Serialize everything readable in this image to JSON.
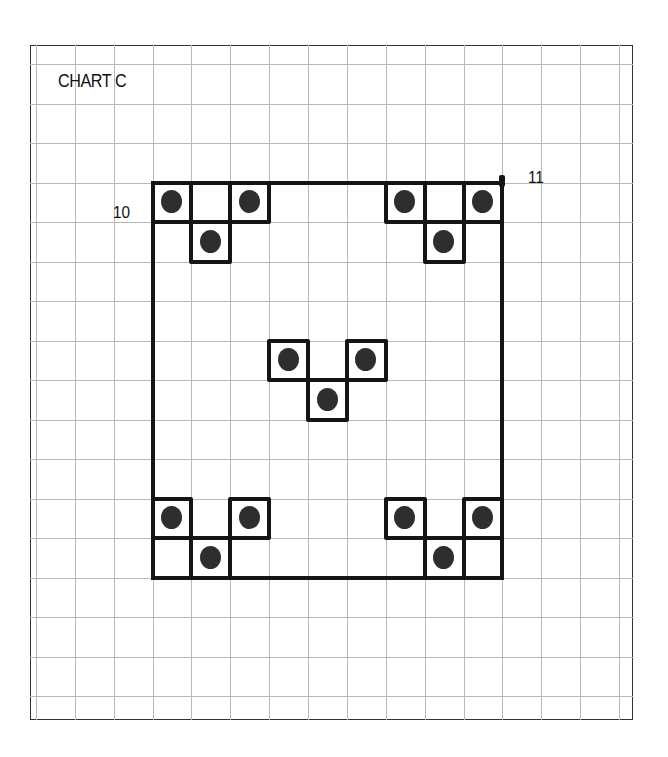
{
  "title": "CHART C",
  "labels": [
    {
      "text": "10",
      "x": 113,
      "y": 203
    },
    {
      "text": "11",
      "x": 528,
      "y": 168
    }
  ],
  "colors": {
    "grid": "#b9b9b9",
    "ink": "#151515",
    "dot": "#2e2e2e",
    "background": "#ffffff"
  },
  "grid": {
    "origin_x": 36,
    "origin_y": 64,
    "step_x": 38.87,
    "step_y": 39.5,
    "cols": 16,
    "rows": 17
  },
  "big_square": {
    "col_start": 3,
    "col_end": 12,
    "row_start": 3,
    "row_end": 13
  },
  "motifs": [
    {
      "name": "top-left",
      "cells": [
        {
          "col": 3,
          "row": 3,
          "dot": true
        },
        {
          "col": 4,
          "row": 3,
          "dot": false
        },
        {
          "col": 5,
          "row": 3,
          "dot": true
        },
        {
          "col": 4,
          "row": 4,
          "dot": true
        }
      ]
    },
    {
      "name": "top-right",
      "cells": [
        {
          "col": 9,
          "row": 3,
          "dot": true
        },
        {
          "col": 10,
          "row": 3,
          "dot": false
        },
        {
          "col": 11,
          "row": 3,
          "dot": true
        },
        {
          "col": 10,
          "row": 4,
          "dot": true
        }
      ]
    },
    {
      "name": "center",
      "cells": [
        {
          "col": 6,
          "row": 7,
          "dot": true
        },
        {
          "col": 8,
          "row": 7,
          "dot": true
        },
        {
          "col": 7,
          "row": 8,
          "dot": true
        }
      ]
    },
    {
      "name": "bottom-left",
      "cells": [
        {
          "col": 3,
          "row": 11,
          "dot": true
        },
        {
          "col": 5,
          "row": 11,
          "dot": true
        },
        {
          "col": 3,
          "row": 12,
          "dot": false
        },
        {
          "col": 4,
          "row": 12,
          "dot": true
        }
      ]
    },
    {
      "name": "bottom-right",
      "cells": [
        {
          "col": 9,
          "row": 11,
          "dot": true
        },
        {
          "col": 11,
          "row": 11,
          "dot": true
        },
        {
          "col": 10,
          "row": 12,
          "dot": true
        },
        {
          "col": 11,
          "row": 12,
          "dot": false
        }
      ]
    }
  ]
}
